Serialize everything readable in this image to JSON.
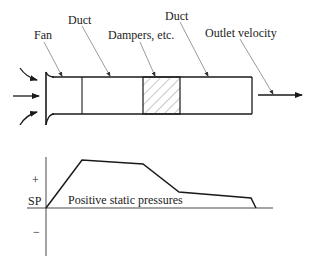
{
  "diagram": {
    "labels": {
      "fan": "Fan",
      "duct_1": "Duct",
      "dampers": "Dampers, etc.",
      "duct_2": "Duct",
      "outlet_velocity": "Outlet velocity"
    },
    "graph": {
      "y_axis_label": "SP",
      "plus_sign": "+",
      "minus_sign": "−",
      "region_label": "Positive static pressures"
    },
    "colors": {
      "line": "#1a1a1a",
      "leader": "#555555",
      "hatch": "#666666"
    }
  }
}
